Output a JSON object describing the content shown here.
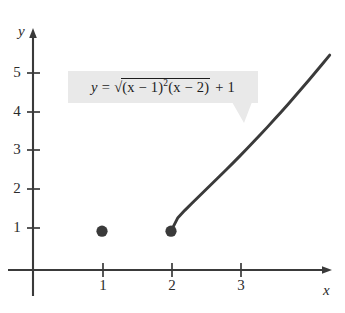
{
  "figure": {
    "type": "graph",
    "background_color": "#ffffff",
    "ink_color": "#3a3a3a",
    "callout_fill": "#e9e9e9"
  },
  "axes": {
    "x_label": "x",
    "y_label": "y",
    "x_ticks": [
      "1",
      "2",
      "3"
    ],
    "y_ticks": [
      "1",
      "2",
      "3",
      "4",
      "5"
    ],
    "x_tick_values": [
      1,
      2,
      3
    ],
    "y_tick_values": [
      1,
      2,
      3,
      4,
      5
    ],
    "x_range": [
      -0.5,
      4.3
    ],
    "y_range": [
      -0.8,
      6.2
    ],
    "grid": false,
    "arrowheads": true
  },
  "equation": {
    "lhs": "y",
    "equals": "=",
    "radical": "√",
    "radicand_part1": "(x − 1)",
    "radicand_exponent": "2",
    "radicand_part2": "(x − 2)",
    "tail": "+ 1",
    "plain": "y = √((x − 1)²(x − 2)) + 1"
  },
  "chart_data": {
    "type": "line",
    "title": "",
    "xlabel": "x",
    "ylabel": "y",
    "xlim": [
      -0.5,
      4.3
    ],
    "ylim": [
      -0.8,
      6.2
    ],
    "grid": false,
    "legend": "none",
    "annotations": [
      {
        "name": "equation-callout",
        "text": "y = √((x − 1)²(x − 2)) + 1",
        "x": 1.0,
        "y": 4.55,
        "points_to": {
          "x": 2.55,
          "y": 3.05
        }
      }
    ],
    "series": [
      {
        "name": "y = sqrt((x-1)^2 (x-2)) + 1",
        "type": "line",
        "color": "#3a3a3a",
        "domain": [
          2,
          4.3
        ],
        "x": [
          2.0,
          2.1,
          2.2,
          2.3,
          2.4,
          2.5,
          2.6,
          2.7,
          2.8,
          2.9,
          3.0,
          3.1,
          3.2,
          3.3,
          3.4,
          3.5,
          3.6,
          3.7,
          3.8,
          3.9,
          4.0,
          4.1,
          4.2,
          4.3
        ],
        "y": [
          1.0,
          1.348,
          1.537,
          1.715,
          1.889,
          2.061,
          2.234,
          2.408,
          2.583,
          2.761,
          2.941,
          3.124,
          3.31,
          3.498,
          3.689,
          3.883,
          4.08,
          4.28,
          4.483,
          4.689,
          4.897,
          5.109,
          5.323,
          5.54
        ]
      }
    ],
    "points": [
      {
        "name": "isolated-point",
        "x": 1,
        "y": 1,
        "marker": "filled-circle",
        "color": "#3a3a3a"
      },
      {
        "name": "curve-endpoint",
        "x": 2,
        "y": 1,
        "marker": "filled-circle",
        "color": "#3a3a3a"
      }
    ]
  }
}
